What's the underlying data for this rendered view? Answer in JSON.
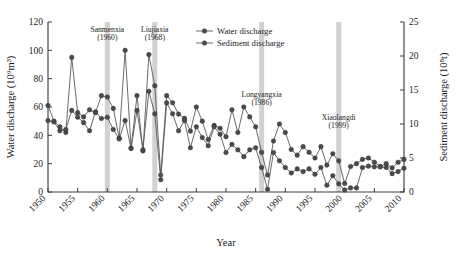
{
  "chart_data": {
    "type": "line",
    "title": "",
    "xlabel": "Year",
    "ylabel": "Water discharge (10⁹m³)",
    "y2label": "Sediment discharge (10⁸t)",
    "xlim": [
      1950,
      2010
    ],
    "ylim": [
      0,
      120
    ],
    "y2lim": [
      0,
      25
    ],
    "xticks": [
      1950,
      1955,
      1960,
      1965,
      1970,
      1975,
      1980,
      1985,
      1990,
      1995,
      2000,
      2005,
      2010
    ],
    "yticks": [
      0,
      20,
      40,
      60,
      80,
      100,
      120
    ],
    "y2ticks": [
      0,
      5,
      10,
      15,
      20,
      25
    ],
    "grid": false,
    "legend_position": "top-right",
    "x": [
      1950,
      1951,
      1952,
      1953,
      1954,
      1955,
      1956,
      1957,
      1958,
      1959,
      1960,
      1961,
      1962,
      1963,
      1964,
      1965,
      1966,
      1967,
      1968,
      1969,
      1970,
      1971,
      1972,
      1973,
      1974,
      1975,
      1976,
      1977,
      1978,
      1979,
      1980,
      1981,
      1982,
      1983,
      1984,
      1985,
      1986,
      1987,
      1988,
      1989,
      1990,
      1991,
      1992,
      1993,
      1994,
      1995,
      1996,
      1997,
      1998,
      1999,
      2000,
      2001,
      2002,
      2003,
      2004,
      2005,
      2006,
      2007,
      2008,
      2009,
      2010
    ],
    "series": [
      {
        "name": "Water discharge",
        "axis": "left",
        "unit": "10⁹m³",
        "values": [
          61,
          50,
          46,
          42,
          95,
          56,
          53,
          58,
          56,
          68,
          67,
          59,
          38,
          100,
          31,
          68,
          29,
          97,
          75,
          12,
          68,
          63,
          55,
          52,
          43,
          60,
          50,
          37,
          47,
          45,
          39,
          58,
          42,
          60,
          53,
          46,
          28,
          12,
          36,
          48,
          42,
          30,
          26,
          32,
          28,
          24,
          32,
          19,
          27,
          22,
          6,
          18,
          20,
          23,
          24,
          21,
          18,
          20,
          17,
          21,
          23
        ]
      },
      {
        "name": "Sediment discharge",
        "axis": "right",
        "unit": "10⁸t",
        "values": [
          10.5,
          10.3,
          9.0,
          9.2,
          12.0,
          11.0,
          10.2,
          9.0,
          11.8,
          10.8,
          11.0,
          9.2,
          7.8,
          10.5,
          6.4,
          12.0,
          6.2,
          14.8,
          11.5,
          1.8,
          13.1,
          11.5,
          9.0,
          10.5,
          6.5,
          9.6,
          8.0,
          6.8,
          9.6,
          8.5,
          5.8,
          7.0,
          6.2,
          5.2,
          6.2,
          6.5,
          3.6,
          0.4,
          5.8,
          4.6,
          3.6,
          2.8,
          3.4,
          3.0,
          3.4,
          2.6,
          3.6,
          1.0,
          2.4,
          1.2,
          0.3,
          0.6,
          0.6,
          3.6,
          3.8,
          3.7,
          3.7,
          3.6,
          2.7,
          3.0,
          3.5
        ]
      }
    ],
    "annotations": [
      {
        "label_line1": "Sanmenxia",
        "label_line2": "(1960)",
        "year": 1960,
        "label_x": 1960,
        "label_y": 113
      },
      {
        "label_line1": "Liujiaxia",
        "label_line2": "(1968)",
        "year": 1968,
        "label_x": 1968,
        "label_y": 113
      },
      {
        "label_line1": "Longyangxia",
        "label_line2": "(1986)",
        "year": 1986,
        "label_x": 1986,
        "label_y": 67
      },
      {
        "label_line1": "Xiaolangdi",
        "label_line2": "(1999)",
        "year": 1999,
        "label_x": 1999,
        "label_y": 51
      }
    ]
  },
  "legend": {
    "items": [
      {
        "label": "Water discharge"
      },
      {
        "label": "Sediment discharge"
      }
    ]
  },
  "colors": {
    "line": "#585858",
    "marker": "#4a4a4a",
    "axis": "#3a3a3a",
    "band": "#c9c9c9",
    "background": "#ffffff"
  }
}
